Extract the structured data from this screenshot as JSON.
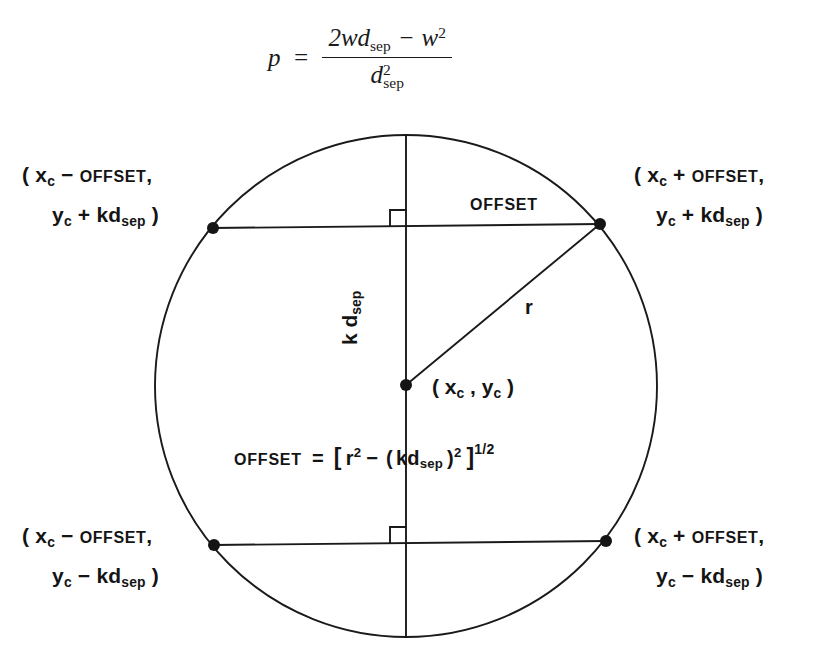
{
  "figure": {
    "type": "geometry-diagram",
    "top_formula": {
      "lhs": "p",
      "equals": "=",
      "numerator_a": "2wd",
      "numerator_a_sub": "sep",
      "numerator_minus": "−",
      "numerator_b": "w",
      "numerator_b_sup": "2",
      "denominator": "d",
      "denominator_sub": "sep",
      "denominator_sup": "2",
      "plain_text": "p = (2wd_sep − w²) / d²_sep"
    },
    "offset_equation": {
      "lhs": "OFFSET",
      "equals": "=",
      "open_bracket": "[",
      "r": "r",
      "r_sup": "2",
      "minus": "−",
      "open_paren": "(",
      "kd": "kd",
      "kd_sub": "sep",
      "close_paren": ")",
      "kd_sup": "2",
      "close_bracket": "]",
      "exponent": "1/2",
      "plain_text": "OFFSET = [ r² − ( kd_sep )² ]^(1/2)"
    },
    "labels": {
      "top_left": {
        "line1_open": "(",
        "line1_var": "x",
        "line1_sub": "c",
        "line1_op": "−",
        "line1_term": "OFFSET",
        "line1_comma": ",",
        "line2_var": "y",
        "line2_sub": "c",
        "line2_op": "+",
        "line2_term": "kd",
        "line2_term_sub": "sep",
        "line2_close": ")",
        "plain_text": "( x_c − OFFSET, y_c + kd_sep )"
      },
      "top_right": {
        "line1_open": "(",
        "line1_var": "x",
        "line1_sub": "c",
        "line1_op": "+",
        "line1_term": "OFFSET",
        "line1_comma": ",",
        "line2_var": "y",
        "line2_sub": "c",
        "line2_op": "+",
        "line2_term": "kd",
        "line2_term_sub": "sep",
        "line2_close": ")",
        "plain_text": "( x_c + OFFSET, y_c + kd_sep )"
      },
      "bottom_left": {
        "line1_open": "(",
        "line1_var": "x",
        "line1_sub": "c",
        "line1_op": "−",
        "line1_term": "OFFSET",
        "line1_comma": ",",
        "line2_var": "y",
        "line2_sub": "c",
        "line2_op": "−",
        "line2_term": "kd",
        "line2_term_sub": "sep",
        "line2_close": ")",
        "plain_text": "( x_c − OFFSET, y_c − kd_sep )"
      },
      "bottom_right": {
        "line1_open": "(",
        "line1_var": "x",
        "line1_sub": "c",
        "line1_op": "+",
        "line1_term": "OFFSET",
        "line1_comma": ",",
        "line2_var": "y",
        "line2_sub": "c",
        "line2_op": "−",
        "line2_term": "kd",
        "line2_term_sub": "sep",
        "line2_close": ")",
        "plain_text": "( x_c + OFFSET, y_c − kd_sep )"
      },
      "offset_segment": "OFFSET",
      "center_point": {
        "open": "(",
        "x_var": "x",
        "x_sub": "c",
        "comma": ",",
        "y_var": "y",
        "y_sub": "c",
        "close": ")",
        "plain_text": "( x_c , y_c )"
      },
      "radius": "r",
      "vertical_segment": {
        "text": "k d",
        "sub": "sep",
        "plain_text": "k d_sep"
      }
    },
    "geometry": {
      "circle_center_x": 406,
      "circle_center_y": 386,
      "circle_radius": 251,
      "upper_chord_y": 225,
      "lower_chord_y": 543,
      "upper_chord_x1": 213,
      "upper_chord_x2": 600,
      "lower_chord_x1": 214,
      "lower_chord_x2": 606,
      "stroke_color": "#1a1a1a",
      "stroke_width": 1.8,
      "point_radius": 5.5,
      "right_angle_marks": 2
    }
  }
}
